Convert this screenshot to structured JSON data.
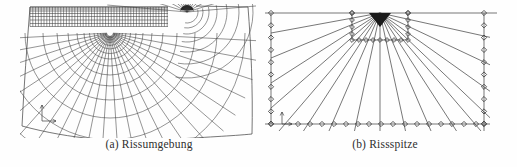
{
  "page": {
    "background": "#fefefe"
  },
  "figures": [
    {
      "id": "a",
      "caption": "(a) Rissumgebung",
      "mesh": {
        "type": "fe-mesh-crack-surroundings",
        "line_color": "#3c3c3c",
        "grid": {
          "x1": 30,
          "x2": 168,
          "y1": 7,
          "y2": 26.5,
          "step": 2.8,
          "rows": [
            7,
            9,
            11,
            13.5,
            16.5,
            20,
            23.5,
            26.5
          ]
        },
        "fan1": {
          "cx": 110,
          "cy": 33,
          "rays": 24,
          "a1": 3,
          "a2": 177,
          "r0": 3,
          "reach": 150,
          "radii": [
            5,
            7,
            9.5,
            12.5,
            16,
            20.5,
            26,
            33,
            42,
            53,
            67,
            85,
            107,
            135
          ]
        },
        "fan2": {
          "cx": 187,
          "cy": 12,
          "discR": 7,
          "rays": 15,
          "a1": 185,
          "a2": 355,
          "reach": 80,
          "radii": [
            11,
            16,
            22,
            30,
            40,
            52,
            66
          ],
          "arcA1": -13,
          "arcA2": 100
        },
        "boundary": [
          "M30,7 L168,7",
          "M196,6 L248,7",
          "M30,7 C27,45 24,85 22,126",
          "M22,126 C70,139 120,143 165,140 C205,137 232,136 252,134",
          "M248,7 C251,45 253,90 252,134"
        ],
        "axes": {
          "ox": 42,
          "oy": 121,
          "top_y": 105,
          "right_x": 56
        }
      }
    },
    {
      "id": "b",
      "caption": "(b) Rissspitze",
      "mesh": {
        "type": "fe-mesh-crack-tip",
        "line_color": "#3c3c3c",
        "marker_color": "#3c3c3c",
        "apex": {
          "x": 122,
          "y": 13
        },
        "frame": {
          "top": {
            "x1": 7,
            "x2": 239,
            "y": 13
          },
          "bottom": {
            "x1": 7,
            "x2": 232,
            "y": 124
          },
          "left": {
            "x": 13,
            "y1": 13,
            "y2": 124
          },
          "right": {
            "x": 226,
            "y1": 13,
            "y2": 131
          },
          "center": {
            "x": 122,
            "y1": 13,
            "y2": 131
          }
        },
        "box": {
          "x1": 94,
          "x2": 150,
          "y1": 13,
          "y2": 40
        },
        "ray_targets_left": [
          33,
          58,
          83,
          108
        ],
        "ray_targets_bottom": [
          27,
          50,
          74,
          98,
          146,
          170,
          194,
          217
        ],
        "ray_targets_right": [
          36,
          62,
          87,
          112
        ],
        "bottom_overshoot_y": 131,
        "right_overshoot_x": 232,
        "diamond_left_ys": [
          13,
          25.3,
          37.6,
          49.9,
          62.2,
          74.5,
          86.8,
          99.1,
          111.4,
          123.7
        ],
        "diamond_right_ys": [
          13,
          25.3,
          37.6,
          49.9,
          62.2,
          74.5,
          86.8,
          99.1,
          111.4,
          123.7
        ],
        "diamond_bottom_xs": [
          13,
          40,
          52,
          64,
          76,
          88,
          100,
          111,
          123,
          135,
          147,
          159,
          171,
          183,
          194,
          206,
          218,
          226
        ],
        "diamond_top_xs": [
          94,
          150
        ],
        "box_col_ys": [
          13,
          20,
          27,
          34
        ],
        "box_row_xs": [
          94,
          101,
          108,
          115,
          122,
          129,
          136,
          143,
          150
        ],
        "apex_triangle": "111,13 133,13 122,27",
        "axes": {
          "ox": 24,
          "oy": 124,
          "top_y": 112,
          "right_x": 34
        }
      }
    }
  ]
}
